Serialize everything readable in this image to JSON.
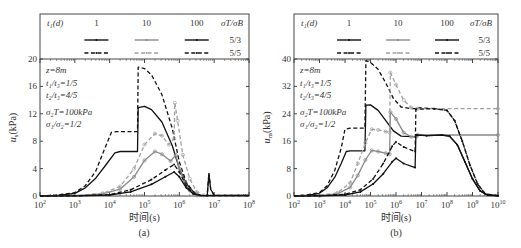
{
  "chart_data": [
    {
      "panel": "(a)",
      "type": "line",
      "xscale": "log",
      "xlabel": "时间(s)",
      "ylabel": "u_s(kPa)",
      "ylabel_main": "u",
      "ylabel_sub": "s",
      "ylabel_unit": "(kPa)",
      "xlim_exp": [
        2,
        8
      ],
      "ylim": [
        0,
        20
      ],
      "yticks": [
        0,
        4,
        8,
        12,
        16,
        20
      ],
      "xtick_exps": [
        2,
        3,
        4,
        5,
        6,
        7,
        8
      ],
      "legend": {
        "header": "t₁(d)",
        "columns": [
          "1",
          "10",
          "100"
        ],
        "ratio_header": "σT/σB",
        "rows": [
          "5/3",
          "5/5"
        ]
      },
      "annotations": [
        "z=8m",
        "t₁/t₃=1/5",
        "t₂/t₃=4/5",
        "σ₂T=100kPa",
        "σ₁/σ₂=1/2"
      ],
      "series": [
        {
          "name": "t3=1d, σT/σB=5/3",
          "color": "#111111",
          "dash": "",
          "points": [
            [
              2,
              0
            ],
            [
              2.5,
              0.1
            ],
            [
              3,
              0.4
            ],
            [
              3.3,
              1.2
            ],
            [
              3.6,
              2.6
            ],
            [
              3.9,
              4.6
            ],
            [
              4.15,
              6.3
            ],
            [
              4.3,
              6.5
            ],
            [
              4.8,
              6.5
            ],
            [
              4.82,
              12.9
            ],
            [
              5.0,
              13.1
            ],
            [
              5.2,
              12.6
            ],
            [
              5.5,
              10.8
            ],
            [
              5.8,
              7.3
            ],
            [
              6.0,
              4.0
            ],
            [
              6.2,
              1.8
            ],
            [
              6.4,
              0.6
            ],
            [
              6.6,
              0.1
            ],
            [
              6.8,
              0.05
            ],
            [
              6.85,
              3.2
            ],
            [
              6.9,
              1.0
            ],
            [
              7.0,
              0.1
            ],
            [
              8,
              0.1
            ]
          ]
        },
        {
          "name": "t3=1d, σT/σB=5/5",
          "color": "#111111",
          "dash": "4,2.5",
          "points": [
            [
              2,
              0
            ],
            [
              2.5,
              0.15
            ],
            [
              3,
              0.5
            ],
            [
              3.3,
              1.5
            ],
            [
              3.6,
              3.6
            ],
            [
              3.85,
              6.8
            ],
            [
              4.05,
              9.3
            ],
            [
              4.2,
              9.4
            ],
            [
              4.8,
              9.4
            ],
            [
              4.82,
              18.8
            ],
            [
              5.0,
              18.6
            ],
            [
              5.2,
              17.7
            ],
            [
              5.5,
              14.8
            ],
            [
              5.8,
              9.8
            ],
            [
              6.0,
              5.0
            ],
            [
              6.2,
              2.0
            ],
            [
              6.4,
              0.6
            ],
            [
              6.6,
              0.1
            ],
            [
              6.8,
              0.05
            ],
            [
              6.85,
              3.4
            ],
            [
              6.9,
              1.0
            ],
            [
              7.0,
              0.1
            ],
            [
              8,
              0.1
            ]
          ]
        },
        {
          "name": "t3=10d, σT/σB=5/3",
          "color": "#8a8a8a",
          "dash": "",
          "marker": "circle",
          "points": [
            [
              2,
              0
            ],
            [
              3,
              0.05
            ],
            [
              3.8,
              0.3
            ],
            [
              4.3,
              1.0
            ],
            [
              4.7,
              2.8
            ],
            [
              5.0,
              5.2
            ],
            [
              5.3,
              6.5
            ],
            [
              5.5,
              6.1
            ],
            [
              5.75,
              5.1
            ],
            [
              5.9,
              6.0
            ],
            [
              6.0,
              4.0
            ],
            [
              6.15,
              2.0
            ],
            [
              6.3,
              0.8
            ],
            [
              6.5,
              0.1
            ],
            [
              8,
              0.05
            ]
          ]
        },
        {
          "name": "t3=10d, σT/σB=5/5",
          "color": "#a0a0a0",
          "dash": "4,2.5",
          "marker": "circle",
          "points": [
            [
              2,
              0
            ],
            [
              3,
              0.05
            ],
            [
              3.8,
              0.4
            ],
            [
              4.3,
              1.4
            ],
            [
              4.7,
              4.0
            ],
            [
              5.0,
              7.5
            ],
            [
              5.3,
              9.1
            ],
            [
              5.5,
              8.8
            ],
            [
              5.7,
              7.5
            ],
            [
              5.85,
              8.4
            ],
            [
              5.87,
              13.6
            ],
            [
              5.95,
              11.0
            ],
            [
              6.1,
              6.0
            ],
            [
              6.3,
              2.5
            ],
            [
              6.5,
              0.6
            ],
            [
              6.7,
              0.1
            ],
            [
              8,
              0.05
            ]
          ]
        },
        {
          "name": "t3=100d, σT/σB=5/3",
          "color": "#111111",
          "dash": "",
          "marker": "dot",
          "points": [
            [
              2,
              0
            ],
            [
              3,
              0.02
            ],
            [
              4,
              0.15
            ],
            [
              4.6,
              0.6
            ],
            [
              5.2,
              1.7
            ],
            [
              5.6,
              2.8
            ],
            [
              5.85,
              3.5
            ],
            [
              6.0,
              2.8
            ],
            [
              6.2,
              1.2
            ],
            [
              6.4,
              0.3
            ],
            [
              6.6,
              0.05
            ],
            [
              8,
              0.05
            ]
          ]
        },
        {
          "name": "t3=100d, σT/σB=5/5",
          "color": "#111111",
          "dash": "4,2.5",
          "marker": "dot",
          "points": [
            [
              2,
              0
            ],
            [
              3,
              0.02
            ],
            [
              4,
              0.2
            ],
            [
              4.6,
              0.9
            ],
            [
              5.2,
              2.4
            ],
            [
              5.6,
              3.8
            ],
            [
              5.85,
              4.6
            ],
            [
              6.0,
              3.5
            ],
            [
              6.2,
              1.5
            ],
            [
              6.4,
              0.4
            ],
            [
              6.6,
              0.05
            ],
            [
              8,
              0.05
            ]
          ]
        }
      ]
    },
    {
      "panel": "(b)",
      "type": "line",
      "xscale": "log",
      "xlabel": "时间(s)",
      "ylabel": "u_m(kPa)",
      "ylabel_main": "u",
      "ylabel_sub": "m",
      "ylabel_unit": "(kPa)",
      "xlim_exp": [
        2,
        10
      ],
      "ylim": [
        0,
        40
      ],
      "yticks": [
        0,
        8,
        16,
        24,
        32,
        40
      ],
      "xtick_exps": [
        2,
        3,
        4,
        5,
        6,
        7,
        8,
        9,
        10
      ],
      "legend": {
        "header": "t₁(d)",
        "columns": [
          "1",
          "10",
          "100"
        ],
        "ratio_header": "σT/σB",
        "rows": [
          "5/3",
          "5/5"
        ]
      },
      "annotations": [
        "z=8m",
        "t₁/t₃=1/5",
        "t₂/t₃=4/5",
        "σ₂T=100kPa",
        "σ₁/σ₂=1/2"
      ],
      "series": [
        {
          "name": "t3=1d, σT/σB=5/3",
          "color": "#111111",
          "dash": "",
          "points": [
            [
              2,
              0
            ],
            [
              2.5,
              0.2
            ],
            [
              3,
              0.8
            ],
            [
              3.3,
              2.4
            ],
            [
              3.6,
              5.5
            ],
            [
              3.85,
              9.5
            ],
            [
              4.05,
              13.0
            ],
            [
              4.2,
              13.2
            ],
            [
              4.78,
              13.2
            ],
            [
              4.82,
              26.5
            ],
            [
              5.0,
              26.6
            ],
            [
              5.3,
              25.0
            ],
            [
              5.6,
              22.0
            ],
            [
              5.9,
              19.0
            ],
            [
              6.2,
              17.5
            ],
            [
              6.6,
              17.3
            ],
            [
              6.8,
              17.3
            ],
            [
              6.82,
              18.0
            ],
            [
              7.2,
              17.6
            ],
            [
              7.8,
              17.8
            ],
            [
              8.1,
              17.5
            ],
            [
              8.4,
              15.0
            ],
            [
              8.7,
              10.0
            ],
            [
              9.0,
              5.0
            ],
            [
              9.3,
              1.5
            ],
            [
              9.6,
              0.2
            ],
            [
              10,
              0.1
            ]
          ]
        },
        {
          "name": "t3=1d, σT/σB=5/5",
          "color": "#111111",
          "dash": "4,2.5",
          "points": [
            [
              2,
              0
            ],
            [
              2.5,
              0.3
            ],
            [
              3,
              1.0
            ],
            [
              3.3,
              3.0
            ],
            [
              3.6,
              7.5
            ],
            [
              3.85,
              14.0
            ],
            [
              4.0,
              19.5
            ],
            [
              4.2,
              19.8
            ],
            [
              4.78,
              19.8
            ],
            [
              4.82,
              39.5
            ],
            [
              5.0,
              39.0
            ],
            [
              5.3,
              37.0
            ],
            [
              5.6,
              33.0
            ],
            [
              5.9,
              28.5
            ],
            [
              6.2,
              26.0
            ],
            [
              6.6,
              25.5
            ],
            [
              6.8,
              25.5
            ],
            [
              6.85,
              25.8
            ],
            [
              7.5,
              25.5
            ],
            [
              8.0,
              25.0
            ],
            [
              8.3,
              22.0
            ],
            [
              8.6,
              16.0
            ],
            [
              8.9,
              9.0
            ],
            [
              9.2,
              3.5
            ],
            [
              9.5,
              0.6
            ],
            [
              10,
              0.1
            ]
          ]
        },
        {
          "name": "t3=10d, σT/σB=5/3",
          "color": "#8a8a8a",
          "dash": "",
          "marker": "circle",
          "points": [
            [
              2,
              0
            ],
            [
              3,
              0.1
            ],
            [
              3.7,
              0.6
            ],
            [
              4.2,
              2.5
            ],
            [
              4.5,
              6.0
            ],
            [
              4.8,
              10.5
            ],
            [
              5.05,
              13.3
            ],
            [
              5.3,
              13.0
            ],
            [
              5.6,
              12.5
            ],
            [
              5.75,
              12.2
            ],
            [
              5.78,
              24.5
            ],
            [
              6.0,
              22.5
            ],
            [
              6.3,
              18.5
            ],
            [
              6.6,
              17.3
            ],
            [
              6.8,
              17.3
            ],
            [
              6.85,
              17.8
            ],
            [
              10,
              17.8
            ]
          ]
        },
        {
          "name": "t3=10d, σT/σB=5/5",
          "color": "#a0a0a0",
          "dash": "4,2.5",
          "marker": "circle",
          "points": [
            [
              2,
              0
            ],
            [
              3,
              0.15
            ],
            [
              3.7,
              0.9
            ],
            [
              4.2,
              3.8
            ],
            [
              4.5,
              9.5
            ],
            [
              4.8,
              15.5
            ],
            [
              5.05,
              19.5
            ],
            [
              5.3,
              19.3
            ],
            [
              5.6,
              18.8
            ],
            [
              5.75,
              18.6
            ],
            [
              5.78,
              36.0
            ],
            [
              6.0,
              32.5
            ],
            [
              6.3,
              28.0
            ],
            [
              6.6,
              25.8
            ],
            [
              6.85,
              25.5
            ],
            [
              10,
              25.5
            ]
          ]
        },
        {
          "name": "t3=100d, σT/σB=5/3",
          "color": "#111111",
          "dash": "",
          "marker": "dot",
          "points": [
            [
              2,
              0
            ],
            [
              3,
              0.05
            ],
            [
              4,
              0.3
            ],
            [
              4.6,
              1.2
            ],
            [
              5.1,
              3.5
            ],
            [
              5.5,
              6.5
            ],
            [
              5.85,
              10.0
            ],
            [
              6.0,
              11.0
            ],
            [
              6.3,
              9.5
            ],
            [
              6.75,
              8.3
            ],
            [
              6.78,
              17.8
            ],
            [
              7.2,
              17.6
            ],
            [
              7.8,
              17.8
            ],
            [
              8.1,
              17.5
            ],
            [
              8.4,
              15.0
            ],
            [
              8.7,
              10.0
            ],
            [
              9.0,
              5.0
            ],
            [
              9.3,
              1.5
            ],
            [
              9.6,
              0.2
            ],
            [
              10,
              0.1
            ]
          ]
        },
        {
          "name": "t3=100d, σT/σB=5/5",
          "color": "#111111",
          "dash": "4,2.5",
          "marker": "dot",
          "points": [
            [
              2,
              0
            ],
            [
              3,
              0.08
            ],
            [
              4,
              0.5
            ],
            [
              4.6,
              1.8
            ],
            [
              5.1,
              5.0
            ],
            [
              5.5,
              9.5
            ],
            [
              5.85,
              14.5
            ],
            [
              6.0,
              15.8
            ],
            [
              6.3,
              14.3
            ],
            [
              6.75,
              13.0
            ],
            [
              6.78,
              25.3
            ],
            [
              7.5,
              25.5
            ],
            [
              8.0,
              25.0
            ],
            [
              8.3,
              22.0
            ],
            [
              8.6,
              16.0
            ],
            [
              8.9,
              9.0
            ],
            [
              9.2,
              3.5
            ],
            [
              9.5,
              0.6
            ],
            [
              10,
              0.1
            ]
          ]
        }
      ]
    }
  ]
}
